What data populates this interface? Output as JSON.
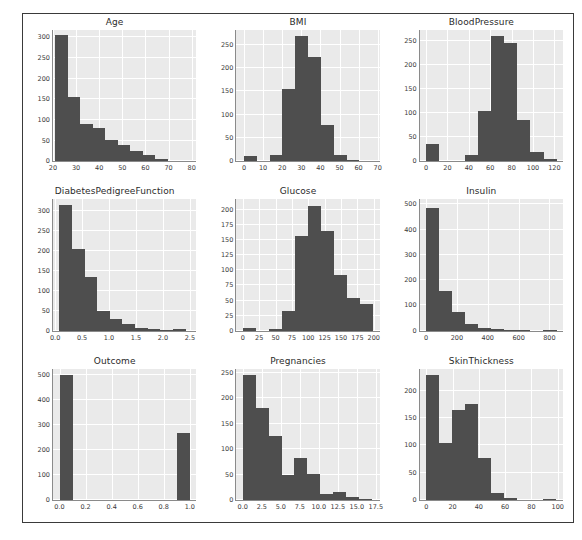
{
  "page": {
    "top_remnant": "",
    "bar_color": "#4e4e4e",
    "plot_bg": "#eaeaea",
    "gridline_color": "#ffffff",
    "frame_color": "#3a3a3a"
  },
  "chart_data": [
    {
      "type": "bar",
      "title": "Age",
      "xlabel": "",
      "ylabel": "",
      "grid": true,
      "legend": "none",
      "xlim": [
        20.0,
        82.0
      ],
      "ylim": [
        0,
        318
      ],
      "xticks": [
        20,
        30,
        40,
        50,
        60,
        70,
        80
      ],
      "xticklabels": [
        "20",
        "30",
        "40",
        "50",
        "60",
        "70",
        "80"
      ],
      "yticks": [
        0,
        50,
        100,
        150,
        200,
        250,
        300
      ],
      "yticklabels": [
        "0",
        "50",
        "100",
        "150",
        "200",
        "250",
        "300"
      ],
      "bin_edges": [
        21.0,
        26.4,
        31.8,
        37.2,
        42.6,
        48.0,
        53.4,
        58.8,
        64.2,
        69.6,
        75.0
      ],
      "values": [
        305,
        155,
        90,
        81,
        51,
        40,
        25,
        16,
        6,
        2
      ],
      "categories": [
        "21-26.4",
        "26.4-31.8",
        "31.8-37.2",
        "37.2-42.6",
        "42.6-48",
        "48-53.4",
        "53.4-58.8",
        "58.8-64.2",
        "64.2-69.6",
        "69.6-75"
      ]
    },
    {
      "type": "bar",
      "title": "BMI",
      "xlabel": "",
      "ylabel": "",
      "grid": true,
      "legend": "none",
      "xlim": [
        -4.0,
        71.0
      ],
      "ylim": [
        0,
        282
      ],
      "xticks": [
        0,
        10,
        20,
        30,
        40,
        50,
        60,
        70
      ],
      "xticklabels": [
        "0",
        "10",
        "20",
        "30",
        "40",
        "50",
        "60",
        "70"
      ],
      "yticks": [
        0,
        50,
        100,
        150,
        200,
        250
      ],
      "yticklabels": [
        "0",
        "50",
        "100",
        "150",
        "200",
        "250"
      ],
      "bin_edges": [
        0.0,
        6.71,
        13.42,
        20.13,
        26.84,
        33.55,
        40.26,
        46.97,
        53.68,
        60.39,
        67.1
      ],
      "values": [
        11,
        0,
        13,
        155,
        270,
        225,
        77,
        13,
        3,
        1
      ],
      "categories": [
        "0-6.7",
        "6.7-13.4",
        "13.4-20.1",
        "20.1-26.8",
        "26.8-33.6",
        "33.6-40.3",
        "40.3-47",
        "47-53.7",
        "53.7-60.4",
        "60.4-67.1"
      ]
    },
    {
      "type": "bar",
      "title": "BloodPressure",
      "xlabel": "",
      "ylabel": "",
      "grid": true,
      "legend": "none",
      "xlim": [
        -6.0,
        128.0
      ],
      "ylim": [
        0,
        272
      ],
      "xticks": [
        0,
        20,
        40,
        60,
        80,
        100,
        120
      ],
      "xticklabels": [
        "0",
        "20",
        "40",
        "60",
        "80",
        "100",
        "120"
      ],
      "yticks": [
        0,
        50,
        100,
        150,
        200,
        250
      ],
      "yticklabels": [
        "0",
        "50",
        "100",
        "150",
        "200",
        "250"
      ],
      "bin_edges": [
        0.0,
        12.2,
        24.4,
        36.6,
        48.8,
        61.0,
        73.2,
        85.4,
        97.6,
        109.8,
        122.0
      ],
      "values": [
        35,
        0,
        1,
        13,
        105,
        260,
        245,
        85,
        20,
        4
      ],
      "categories": [
        "0-12.2",
        "12.2-24.4",
        "24.4-36.6",
        "36.6-48.8",
        "48.8-61",
        "61-73.2",
        "73.2-85.4",
        "85.4-97.6",
        "97.6-109.8",
        "109.8-122"
      ]
    },
    {
      "type": "bar",
      "title": "DiabetesPedigreeFunction",
      "xlabel": "",
      "ylabel": "",
      "grid": true,
      "legend": "none",
      "xlim": [
        -0.04,
        2.62
      ],
      "ylim": [
        0,
        330
      ],
      "xticks": [
        0.0,
        0.5,
        1.0,
        1.5,
        2.0,
        2.5
      ],
      "xticklabels": [
        "0.0",
        "0.5",
        "1.0",
        "1.5",
        "2.0",
        "2.5"
      ],
      "yticks": [
        0,
        50,
        100,
        150,
        200,
        250,
        300
      ],
      "yticklabels": [
        "0",
        "50",
        "100",
        "150",
        "200",
        "250",
        "300"
      ],
      "bin_edges": [
        0.078,
        0.312,
        0.546,
        0.781,
        1.015,
        1.249,
        1.483,
        1.718,
        1.952,
        2.186,
        2.42
      ],
      "values": [
        315,
        205,
        135,
        50,
        30,
        16,
        6,
        3,
        1,
        3
      ],
      "categories": [
        "0.078-0.312",
        "0.312-0.546",
        "0.546-0.781",
        "0.781-1.015",
        "1.015-1.249",
        "1.249-1.483",
        "1.483-1.718",
        "1.718-1.952",
        "1.952-2.186",
        "2.186-2.42"
      ]
    },
    {
      "type": "bar",
      "title": "Glucose",
      "xlabel": "",
      "ylabel": "",
      "grid": true,
      "legend": "none",
      "xlim": [
        -10.0,
        209.0
      ],
      "ylim": [
        0,
        218
      ],
      "xticks": [
        0,
        25,
        50,
        75,
        100,
        125,
        150,
        175,
        200
      ],
      "xticklabels": [
        "0",
        "25",
        "50",
        "75",
        "100",
        "125",
        "150",
        "175",
        "200"
      ],
      "yticks": [
        0,
        25,
        50,
        75,
        100,
        125,
        150,
        175,
        200
      ],
      "yticklabels": [
        "0",
        "25",
        "50",
        "75",
        "100",
        "125",
        "150",
        "175",
        "200"
      ],
      "bin_edges": [
        0.0,
        19.9,
        39.8,
        59.7,
        79.6,
        99.5,
        119.4,
        139.3,
        159.2,
        179.1,
        199.0
      ],
      "values": [
        5,
        0,
        2,
        32,
        157,
        207,
        165,
        93,
        55,
        45
      ],
      "categories": [
        "0-19.9",
        "19.9-39.8",
        "39.8-59.7",
        "59.7-79.6",
        "79.6-99.5",
        "99.5-119.4",
        "119.4-139.3",
        "139.3-159.2",
        "159.2-179.1",
        "179.1-199"
      ]
    },
    {
      "type": "bar",
      "title": "Insulin",
      "xlabel": "",
      "ylabel": "",
      "grid": true,
      "legend": "none",
      "xlim": [
        -42.0,
        888.0
      ],
      "ylim": [
        0,
        520
      ],
      "xticks": [
        0,
        200,
        400,
        600,
        800
      ],
      "xticklabels": [
        "0",
        "200",
        "400",
        "600",
        "800"
      ],
      "yticks": [
        0,
        100,
        200,
        300,
        400,
        500
      ],
      "yticklabels": [
        "0",
        "100",
        "200",
        "300",
        "400",
        "500"
      ],
      "bin_edges": [
        0.0,
        84.6,
        169.2,
        253.8,
        338.4,
        423.0,
        507.6,
        592.2,
        676.8,
        761.4,
        846.0
      ],
      "values": [
        487,
        157,
        75,
        25,
        12,
        6,
        3,
        1,
        0,
        2
      ],
      "categories": [
        "0-84.6",
        "84.6-169.2",
        "169.2-253.8",
        "253.8-338.4",
        "338.4-423",
        "423-507.6",
        "507.6-592.2",
        "592.2-676.8",
        "676.8-761.4",
        "761.4-846"
      ]
    },
    {
      "type": "bar",
      "title": "Outcome",
      "xlabel": "",
      "ylabel": "",
      "grid": true,
      "legend": "none",
      "xlim": [
        -0.05,
        1.05
      ],
      "ylim": [
        0,
        525
      ],
      "xticks": [
        0.0,
        0.2,
        0.4,
        0.6,
        0.8,
        1.0
      ],
      "xticklabels": [
        "0.0",
        "0.2",
        "0.4",
        "0.6",
        "0.8",
        "1.0"
      ],
      "yticks": [
        0,
        100,
        200,
        300,
        400,
        500
      ],
      "yticklabels": [
        "0",
        "100",
        "200",
        "300",
        "400",
        "500"
      ],
      "bin_edges": [
        0.0,
        0.1,
        0.2,
        0.3,
        0.4,
        0.5,
        0.6,
        0.7,
        0.8,
        0.9,
        1.0
      ],
      "values": [
        500,
        0,
        0,
        0,
        0,
        0,
        0,
        0,
        0,
        268
      ],
      "categories": [
        "0",
        "1"
      ]
    },
    {
      "type": "bar",
      "title": "Pregnancies",
      "xlabel": "",
      "ylabel": "",
      "grid": true,
      "legend": "none",
      "xlim": [
        -0.85,
        18.0
      ],
      "ylim": [
        0,
        258
      ],
      "xticks": [
        0.0,
        2.5,
        5.0,
        7.5,
        10.0,
        12.5,
        15.0,
        17.5
      ],
      "xticklabels": [
        "0.0",
        "2.5",
        "5.0",
        "7.5",
        "10.0",
        "12.5",
        "15.0",
        "17.5"
      ],
      "yticks": [
        0,
        50,
        100,
        150,
        200,
        250
      ],
      "yticklabels": [
        "0",
        "50",
        "100",
        "150",
        "200",
        "250"
      ],
      "bin_edges": [
        0.0,
        1.7,
        3.4,
        5.1,
        6.8,
        8.5,
        10.2,
        11.9,
        13.6,
        15.3,
        17.0
      ],
      "values": [
        245,
        180,
        125,
        50,
        83,
        51,
        11,
        16,
        6,
        1
      ],
      "categories": [
        "0-1.7",
        "1.7-3.4",
        "3.4-5.1",
        "5.1-6.8",
        "6.8-8.5",
        "8.5-10.2",
        "10.2-11.9",
        "11.9-13.6",
        "13.6-15.3",
        "15.3-17"
      ]
    },
    {
      "type": "bar",
      "title": "SkinThickness",
      "xlabel": "",
      "ylabel": "",
      "grid": true,
      "legend": "none",
      "xlim": [
        -5.0,
        104.0
      ],
      "ylim": [
        0,
        240
      ],
      "xticks": [
        0,
        20,
        40,
        60,
        80,
        100
      ],
      "xticklabels": [
        "0",
        "20",
        "40",
        "60",
        "80",
        "100"
      ],
      "yticks": [
        0,
        50,
        100,
        150,
        200
      ],
      "yticklabels": [
        "0",
        "50",
        "100",
        "150",
        "200"
      ],
      "bin_edges": [
        0.0,
        9.9,
        19.8,
        29.7,
        39.6,
        49.5,
        59.4,
        69.3,
        79.2,
        89.1,
        99.0
      ],
      "values": [
        228,
        105,
        165,
        176,
        77,
        13,
        3,
        0,
        0,
        1
      ],
      "categories": [
        "0-9.9",
        "9.9-19.8",
        "19.8-29.7",
        "29.7-39.6",
        "39.6-49.5",
        "49.5-59.4",
        "59.4-69.3",
        "69.3-79.2",
        "79.2-89.1",
        "89.1-99"
      ]
    }
  ]
}
